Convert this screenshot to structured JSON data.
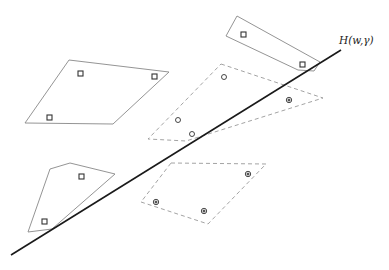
{
  "diagram": {
    "type": "separating-hyperplane-illustration",
    "hyperplane_label": "H(w,γ)",
    "legend_semantics": {
      "square": "class A point",
      "open_circle": "class B point",
      "dotted_circle": "class B point (dotted marker)"
    },
    "clusters": [
      {
        "id": "top-right-solid",
        "style": "solid",
        "marker": "square",
        "count": 2
      },
      {
        "id": "upper-left-solid",
        "style": "solid",
        "marker": "square",
        "count": 3
      },
      {
        "id": "lower-left-solid",
        "style": "solid",
        "marker": "square",
        "count": 2
      },
      {
        "id": "middle-dashed",
        "style": "dashed",
        "markers": [
          "open-circle",
          "open-circle",
          "open-circle",
          "dotted-circle"
        ],
        "count": 4
      },
      {
        "id": "lower-right-dashed",
        "style": "dashed",
        "marker": "dotted-circle",
        "count": 3
      }
    ]
  }
}
